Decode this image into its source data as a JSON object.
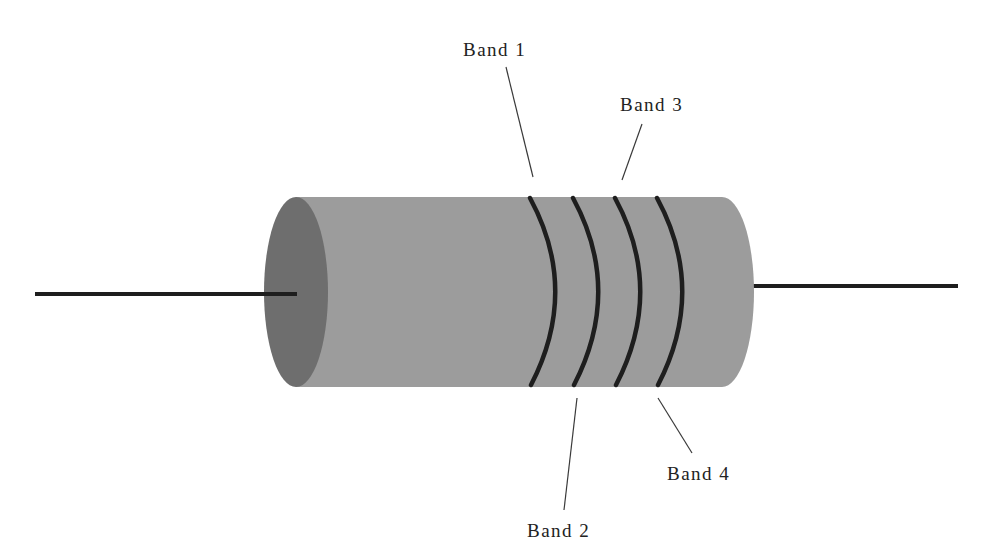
{
  "diagram": {
    "colors": {
      "background": "#ffffff",
      "body": "#9c9c9c",
      "end_cap": "#6e6e6e",
      "bands": "#1e1e1e",
      "leads": "#1e1e1e",
      "leader_lines": "#3a3a3a",
      "text": "#222222"
    },
    "labels": [
      {
        "id": "band1",
        "text": "Band 1"
      },
      {
        "id": "band2",
        "text": "Band 2"
      },
      {
        "id": "band3",
        "text": "Band 3"
      },
      {
        "id": "band4",
        "text": "Band 4"
      }
    ]
  }
}
